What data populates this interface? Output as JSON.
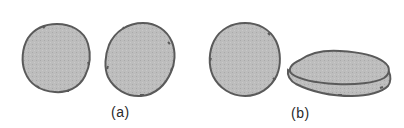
{
  "figure": {
    "panels": [
      {
        "label": "(a)",
        "description": "Two roughly circular, irregular gray cells seen face-on",
        "shapes": [
          "round-cell",
          "round-cell"
        ]
      },
      {
        "label": "(b)",
        "description": "One round cell face-on and one flattened disc-shaped cell seen obliquely",
        "shapes": [
          "round-cell",
          "flattened-disc"
        ]
      }
    ],
    "colors": {
      "fill": "#b9b9b9",
      "stroke": "#5a5a5a",
      "background": "#ffffff",
      "label": "#2a2a2a"
    }
  }
}
